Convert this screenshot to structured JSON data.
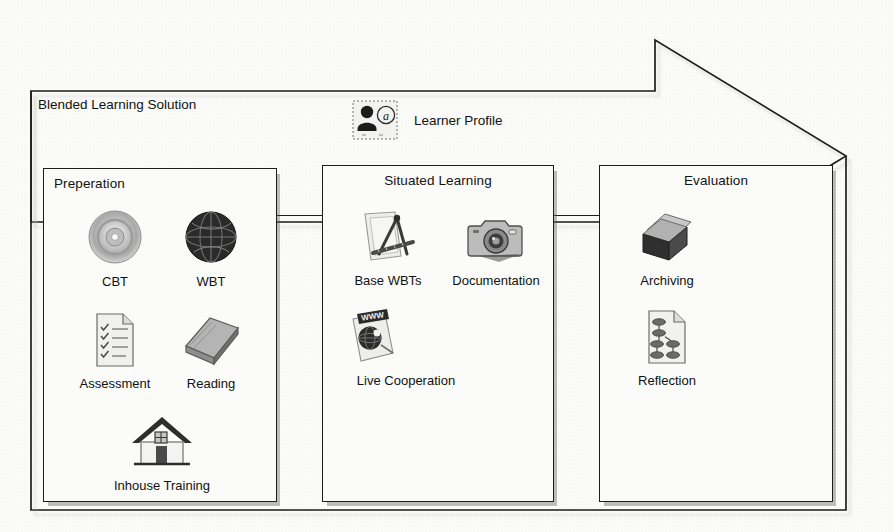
{
  "diagram": {
    "title": "Blended Learning Solution",
    "type": "process-flow-arrow",
    "direction": "left-to-right",
    "learner_profile": {
      "label": "Learner Profile",
      "icon": "user-at-symbol-icon"
    },
    "stages": [
      {
        "id": "preperation",
        "title": "Preperation",
        "title_align": "left",
        "items": [
          {
            "label": "CBT",
            "icon": "compact-disc-icon"
          },
          {
            "label": "WBT",
            "icon": "globe-icon"
          },
          {
            "label": "Assessment",
            "icon": "checklist-document-icon"
          },
          {
            "label": "Reading",
            "icon": "book-icon"
          },
          {
            "label": "Inhouse Training",
            "icon": "house-icon"
          }
        ]
      },
      {
        "id": "situated-learning",
        "title": "Situated Learning",
        "title_align": "center",
        "items": [
          {
            "label": "Base WBTs",
            "icon": "document-ruler-compass-icon"
          },
          {
            "label": "Documentation",
            "icon": "camera-icon"
          },
          {
            "label": "Live Cooperation",
            "icon": "www-globe-document-icon"
          }
        ]
      },
      {
        "id": "evaluation",
        "title": "Evaluation",
        "title_align": "center",
        "items": [
          {
            "label": "Archiving",
            "icon": "archive-box-icon"
          },
          {
            "label": "Reflection",
            "icon": "flowchart-document-icon"
          }
        ]
      }
    ],
    "colors": {
      "stroke": "#1d1d1d",
      "panel_fill": "#fbfbfa",
      "page_background": "#fcfcfb",
      "shadow": "#9a9a9a",
      "text": "#111111"
    }
  }
}
